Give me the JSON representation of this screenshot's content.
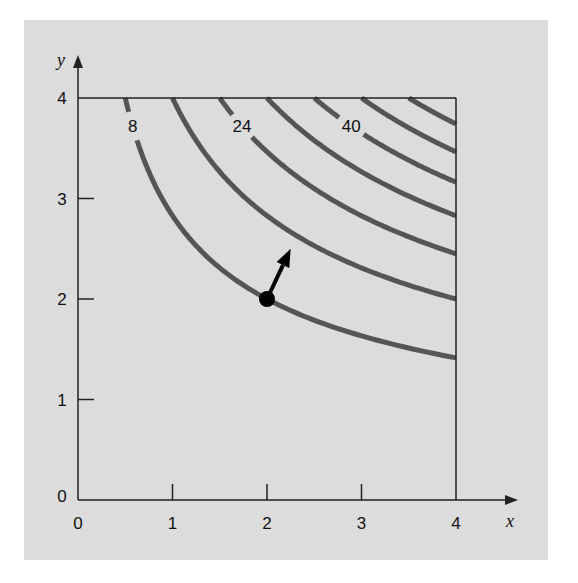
{
  "chart_data": {
    "type": "line",
    "subtype": "contour",
    "title": "",
    "function": "f(x, y) = x * y^2",
    "xlabel": "x",
    "ylabel": "y",
    "xlim": [
      0,
      4
    ],
    "ylim": [
      0,
      4
    ],
    "x_ticks": [
      "0",
      "1",
      "2",
      "3",
      "4"
    ],
    "y_ticks": [
      "0",
      "1",
      "2",
      "3",
      "4"
    ],
    "grid": false,
    "legend": null,
    "contour_levels": [
      8,
      16,
      24,
      32,
      40,
      48,
      56
    ],
    "contour_labels": [
      {
        "text": "8",
        "level": 8
      },
      {
        "text": "24",
        "level": 24
      },
      {
        "text": "40",
        "level": 40
      }
    ],
    "series": [
      {
        "name": "f=8",
        "top_edge_x": 0.5,
        "right_edge_y": 1.41
      },
      {
        "name": "f=16",
        "top_edge_x": 1.0,
        "right_edge_y": 2.0
      },
      {
        "name": "f=24",
        "top_edge_x": 1.5,
        "right_edge_y": 2.45
      },
      {
        "name": "f=32",
        "top_edge_x": 2.0,
        "right_edge_y": 2.83
      },
      {
        "name": "f=40",
        "top_edge_x": 2.5,
        "right_edge_y": 3.16
      },
      {
        "name": "f=48",
        "top_edge_x": 3.0,
        "right_edge_y": 3.46
      },
      {
        "name": "f=56",
        "top_edge_x": 3.5,
        "right_edge_y": 3.74
      }
    ],
    "annotations": [
      {
        "type": "point",
        "x": 2,
        "y": 2,
        "label": ""
      },
      {
        "type": "gradient-arrow",
        "from": [
          2,
          2
        ],
        "to": [
          2.25,
          2.5
        ],
        "label": ""
      }
    ]
  },
  "colors": {
    "panel": "#dcdcdc",
    "contour": "#555555",
    "axis": "#222222",
    "marker": "#000000"
  }
}
